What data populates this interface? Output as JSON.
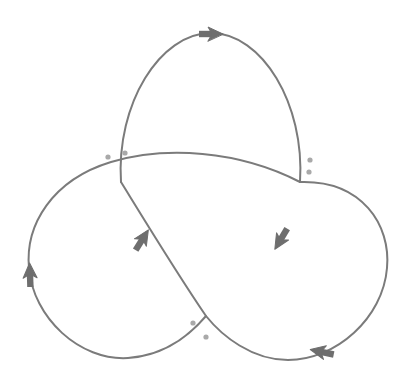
{
  "figure": {
    "type": "knot-diagram",
    "width": 413,
    "height": 386,
    "background_color": "#ffffff",
    "stroke_color": "#7b7b7b",
    "stroke_width": 2.0,
    "dot_color": "#a9a9a9",
    "dot_radius": 2.6,
    "arrow_color": "#6e6e6e",
    "arrow_count": 6,
    "crossing_count": 3,
    "lobe_count": 3,
    "strand_count": 3
  },
  "strands": [
    {
      "name": "strand-upper-loop",
      "d": "M 121 182 C 116 104 160 33 211 33 C 262 33 305 104 300 182"
    },
    {
      "name": "strand-left-loop",
      "d": "M 300 182 C 238 150 165 146 111 162 C 52 180 25 225 29 268 C 33 318 80 361 128 358 C 170 355 194 330 206 316"
    },
    {
      "name": "strand-right-loop",
      "d": "M 121 182 C 142 216 176 272 206 316 C 222 336 252 360 288 360 C 336 360 383 318 387 268 C 391 225 362 180 300 182"
    }
  ],
  "arrows": [
    {
      "name": "arrow-top",
      "x": 211,
      "y": 34,
      "angle": 0,
      "direction": "right"
    },
    {
      "name": "arrow-left-outer",
      "x": 30,
      "y": 275,
      "angle": -92,
      "direction": "up"
    },
    {
      "name": "arrow-bottom-right",
      "x": 322,
      "y": 352,
      "angle": 192,
      "direction": "left"
    },
    {
      "name": "arrow-inner-left",
      "x": 142,
      "y": 240,
      "angle": -58,
      "direction": "up-right"
    },
    {
      "name": "arrow-inner-right",
      "x": 281,
      "y": 239,
      "angle": 121,
      "direction": "down-left"
    }
  ],
  "crossing_dots": [
    {
      "name": "dot-left-outer",
      "x": 108,
      "y": 157
    },
    {
      "name": "dot-left-inner",
      "x": 125,
      "y": 153
    },
    {
      "name": "dot-right-upper",
      "x": 310,
      "y": 160
    },
    {
      "name": "dot-right-lower",
      "x": 309,
      "y": 172
    },
    {
      "name": "dot-bottom-upper",
      "x": 193,
      "y": 323
    },
    {
      "name": "dot-bottom-lower",
      "x": 206,
      "y": 337
    }
  ],
  "crossings": [
    {
      "name": "crossing-left",
      "x": 118,
      "y": 166
    },
    {
      "name": "crossing-right",
      "x": 302,
      "y": 168
    },
    {
      "name": "crossing-bottom",
      "x": 206,
      "y": 317
    }
  ]
}
